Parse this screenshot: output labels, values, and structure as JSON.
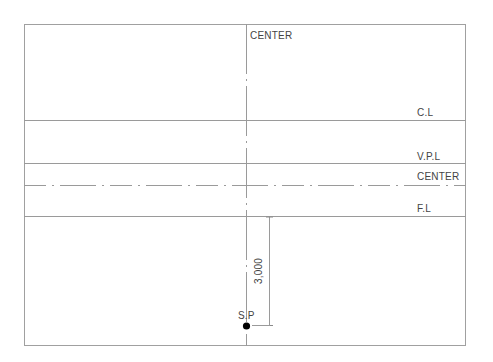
{
  "diagram": {
    "labels": {
      "center_top": "CENTER",
      "ceiling_line": "C.L",
      "vpl": "V.P.L",
      "center_horizontal": "CENTER",
      "floor_line": "F.L",
      "dimension": "3,000",
      "station_point": "S.P"
    },
    "colors": {
      "line": "#9a9a9a",
      "text": "#444444",
      "point": "#000000"
    }
  }
}
